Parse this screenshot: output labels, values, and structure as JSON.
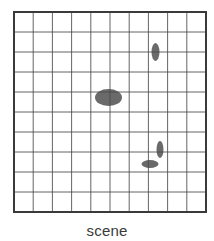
{
  "caption": "scene",
  "grid": {
    "left": 14,
    "top": 12,
    "right": 206,
    "bottom": 212,
    "columns": 10,
    "rows": 10,
    "line_color": "#4a4a4a",
    "border_color": "#3a3a3a",
    "line_width": 1,
    "border_width": 2
  },
  "blobs": [
    {
      "name": "large-blob",
      "cx": 108.5,
      "cy": 97.5,
      "rx": 13.5,
      "ry": 8.5,
      "color": "#6a6a6a"
    },
    {
      "name": "top-right-vertical-blob",
      "cx": 155.5,
      "cy": 52,
      "rx": 4,
      "ry": 9,
      "color": "#6a6a6a"
    },
    {
      "name": "bottom-right-vertical-blob",
      "cx": 160,
      "cy": 149.5,
      "rx": 3.5,
      "ry": 8.5,
      "color": "#6a6a6a"
    },
    {
      "name": "bottom-right-horizontal-blob",
      "cx": 150,
      "cy": 164,
      "rx": 8.5,
      "ry": 4,
      "color": "#6a6a6a"
    }
  ]
}
